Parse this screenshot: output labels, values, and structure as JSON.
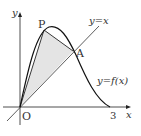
{
  "diagram": {
    "labels": {
      "y_axis": "y",
      "x_axis": "x",
      "origin": "O",
      "x_tick": "3",
      "point_p": "P",
      "point_a": "A",
      "line_label": "y=x",
      "curve_label": "y=f(x)"
    },
    "colors": {
      "stroke": "#222222",
      "fill": "#e4e4e4",
      "background": "#ffffff"
    }
  }
}
